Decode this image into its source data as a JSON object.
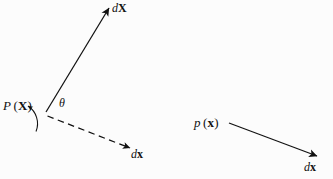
{
  "figure": {
    "type": "vector-diagram",
    "background_color": "#fcfcfc",
    "stroke_color": "#111111",
    "width": 333,
    "height": 179
  },
  "labels": {
    "point_reference": {
      "symbol": "P",
      "arg_open": "(",
      "arg": "X",
      "arg_close": ")"
    },
    "vector_dX": {
      "d": "d",
      "v": "X"
    },
    "vector_dx_left": {
      "d": "d",
      "v": "x"
    },
    "point_current": {
      "symbol": "p",
      "arg_open": "(",
      "arg": "x",
      "arg_close": ")"
    },
    "vector_dx_right": {
      "d": "d",
      "v": "x"
    },
    "angle": {
      "symbol": "θ"
    }
  },
  "geometry": {
    "solid_arrow_dX": {
      "x1": 46,
      "y1": 112,
      "x2": 110,
      "y2": 6
    },
    "dashed_arrow_dx": {
      "x1": 47,
      "y1": 116,
      "x2": 132,
      "y2": 149
    },
    "solid_arrow_right_dx": {
      "x1": 229,
      "y1": 123,
      "x2": 318,
      "y2": 157
    },
    "angle_arc": {
      "cx": 47,
      "cy": 114,
      "r": 21
    }
  }
}
